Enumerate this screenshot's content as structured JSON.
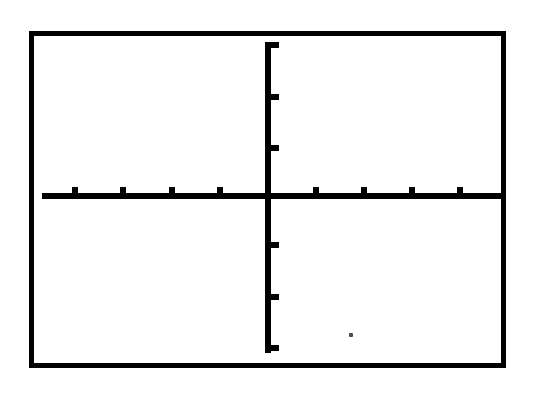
{
  "screen": {
    "device": "graphing-calculator",
    "title": "Graphing calculator display",
    "background_color": "#FFFFFF",
    "ink_color": "#000000",
    "frame": {
      "left": 29,
      "top": 31,
      "width": 477,
      "height": 337,
      "border_thickness_px": 5
    }
  },
  "chart_data": {
    "type": "line",
    "title": "",
    "subtitle": "",
    "xlabel": "",
    "ylabel": "",
    "series": [],
    "x": [],
    "values": [],
    "grid": false,
    "legend": false,
    "legend_position": "none",
    "axes": {
      "x_axis": {
        "visible": true,
        "orientation": "horizontal",
        "line_thickness_px": 6,
        "start_x_px": 42,
        "end_x_px": 501,
        "y_px": 196,
        "tick_count": 8,
        "tick_labels": [],
        "tick_positions_px": [
          75,
          123,
          172,
          220,
          316,
          364,
          412,
          460
        ],
        "tick_spacing_px": 48,
        "tick_direction": "up",
        "xlim": [
          -4.8,
          4.8
        ]
      },
      "y_axis": {
        "visible": true,
        "orientation": "vertical",
        "line_thickness_px": 6,
        "start_y_px": 42,
        "end_y_px": 353,
        "x_px": 268,
        "tick_count": 6,
        "tick_labels": [],
        "tick_positions_px": [
          45,
          97,
          148,
          245,
          297,
          348
        ],
        "tick_spacing_px": 51,
        "tick_direction": "right",
        "ylim": [
          -3.0,
          3.0
        ]
      }
    },
    "origin_px": {
      "x": 268,
      "y": 196
    }
  },
  "artifacts": [
    {
      "name": "scan-speck",
      "x": 349,
      "y": 333,
      "size": 4
    }
  ]
}
